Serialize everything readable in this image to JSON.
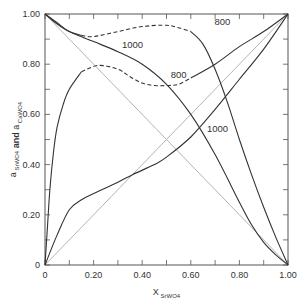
{
  "chart_data": {
    "type": "line",
    "title": "",
    "xlabel": "X",
    "xlabel_sub": "SrWO4",
    "ylabel_parts": [
      {
        "t": "a",
        "sub": "SrWO4"
      },
      {
        "t": " and ",
        "bold": true
      },
      {
        "t": "a",
        "sub": "CaWO4"
      }
    ],
    "xlim": [
      0,
      1.0
    ],
    "ylim": [
      0,
      1.0
    ],
    "grid": false,
    "x_tick_labels": [
      "0",
      "0.20",
      "0.40",
      "0.60",
      "0.80",
      "1.00"
    ],
    "x_tick_values": [
      0,
      0.2,
      0.4,
      0.6,
      0.8,
      1.0
    ],
    "x_minor_ticks": [
      0.1,
      0.3,
      0.5,
      0.7,
      0.9
    ],
    "y_tick_labels": [
      "0",
      "0.20",
      "0.40",
      "0.60",
      "0.80",
      "1.00"
    ],
    "y_tick_values": [
      0,
      0.2,
      0.4,
      0.6,
      0.8,
      1.0
    ],
    "y_minor_ticks": [
      0.1,
      0.3,
      0.5,
      0.7,
      0.9
    ],
    "series": [
      {
        "name": "ideal a_SrWO4",
        "color": "#aaaaaa",
        "dash": false,
        "segments": [
          [
            [
              0,
              0
            ],
            [
              1,
              1
            ]
          ]
        ]
      },
      {
        "name": "ideal a_CaWO4",
        "color": "#aaaaaa",
        "dash": false,
        "segments": [
          [
            [
              0,
              1
            ],
            [
              1,
              0
            ]
          ]
        ]
      },
      {
        "name": "1000 a_SrWO4",
        "label": "1000",
        "color": "#333333",
        "dash": false,
        "segments": [
          [
            [
              0,
              0
            ],
            [
              0.05,
              0.12
            ],
            [
              0.1,
              0.22
            ],
            [
              0.15,
              0.26
            ],
            [
              0.2,
              0.285
            ],
            [
              0.3,
              0.33
            ],
            [
              0.36,
              0.36
            ],
            [
              0.45,
              0.4
            ],
            [
              0.5,
              0.43
            ],
            [
              0.6,
              0.51
            ],
            [
              0.7,
              0.62
            ],
            [
              0.8,
              0.74
            ],
            [
              0.9,
              0.86
            ],
            [
              1,
              1
            ]
          ]
        ]
      },
      {
        "name": "1000 a_CaWO4",
        "label": "1000",
        "color": "#333333",
        "dash": false,
        "segments": [
          [
            [
              0,
              1
            ],
            [
              0.05,
              0.965
            ],
            [
              0.1,
              0.93
            ],
            [
              0.2,
              0.89
            ],
            [
              0.3,
              0.85
            ],
            [
              0.4,
              0.8
            ],
            [
              0.5,
              0.72
            ],
            [
              0.6,
              0.6
            ],
            [
              0.7,
              0.44
            ],
            [
              0.8,
              0.25
            ],
            [
              0.85,
              0.16
            ],
            [
              0.9,
              0.09
            ],
            [
              0.95,
              0.04
            ],
            [
              1,
              0
            ]
          ]
        ]
      },
      {
        "name": "800 a_SrWO4",
        "label": "800",
        "color": "#333333",
        "segments": [
          {
            "dash": false,
            "pts": [
              [
                0,
                0
              ],
              [
                0.01,
                0.15
              ],
              [
                0.02,
                0.3
              ],
              [
                0.035,
                0.45
              ],
              [
                0.05,
                0.55
              ],
              [
                0.075,
                0.64
              ],
              [
                0.1,
                0.7
              ],
              [
                0.15,
                0.77
              ]
            ]
          },
          {
            "dash": true,
            "pts": [
              [
                0.15,
                0.77
              ],
              [
                0.22,
                0.795
              ],
              [
                0.3,
                0.78
              ],
              [
                0.35,
                0.75
              ],
              [
                0.4,
                0.725
              ],
              [
                0.45,
                0.715
              ],
              [
                0.5,
                0.715
              ],
              [
                0.55,
                0.72
              ],
              [
                0.6,
                0.745
              ]
            ]
          },
          {
            "dash": false,
            "pts": [
              [
                0.6,
                0.745
              ],
              [
                0.7,
                0.8
              ],
              [
                0.8,
                0.87
              ],
              [
                0.9,
                0.93
              ],
              [
                1,
                1
              ]
            ]
          }
        ]
      },
      {
        "name": "800 a_CaWO4",
        "label": "800",
        "color": "#333333",
        "segments": [
          {
            "dash": false,
            "pts": [
              [
                0,
                1
              ],
              [
                0.05,
                0.96
              ],
              [
                0.1,
                0.93
              ],
              [
                0.15,
                0.915
              ]
            ]
          },
          {
            "dash": true,
            "pts": [
              [
                0.15,
                0.915
              ],
              [
                0.2,
                0.91
              ],
              [
                0.3,
                0.93
              ],
              [
                0.4,
                0.95
              ],
              [
                0.5,
                0.955
              ],
              [
                0.55,
                0.945
              ],
              [
                0.6,
                0.93
              ]
            ]
          },
          {
            "dash": false,
            "pts": [
              [
                0.6,
                0.93
              ],
              [
                0.65,
                0.88
              ],
              [
                0.7,
                0.78
              ],
              [
                0.75,
                0.65
              ],
              [
                0.8,
                0.5
              ],
              [
                0.85,
                0.36
              ],
              [
                0.9,
                0.23
              ],
              [
                0.95,
                0.11
              ],
              [
                1,
                0
              ]
            ]
          }
        ]
      }
    ],
    "annotations": [
      {
        "text": "1000",
        "x": 0.36,
        "y": 0.865
      },
      {
        "text": "800",
        "x": 0.73,
        "y": 0.955
      },
      {
        "text": "800",
        "x": 0.55,
        "y": 0.745
      },
      {
        "text": "1000",
        "x": 0.71,
        "y": 0.53
      }
    ]
  }
}
